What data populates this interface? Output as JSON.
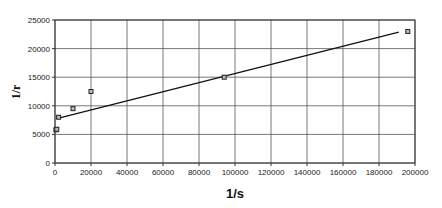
{
  "chart_data": {
    "type": "scatter",
    "title": "",
    "xlabel": "1/s",
    "ylabel": "1/r",
    "xlim": [
      0,
      200000
    ],
    "ylim": [
      0,
      25000
    ],
    "grid": true,
    "legend": null,
    "xticks": [
      0,
      20000,
      40000,
      60000,
      80000,
      100000,
      120000,
      140000,
      160000,
      180000,
      200000
    ],
    "yticks": [
      0,
      5000,
      10000,
      15000,
      20000,
      25000
    ],
    "series": [
      {
        "name": "data",
        "marker": "square",
        "points": [
          {
            "x": 500,
            "y": 5800
          },
          {
            "x": 1000,
            "y": 5900
          },
          {
            "x": 2000,
            "y": 8000
          },
          {
            "x": 10000,
            "y": 9500
          },
          {
            "x": 20000,
            "y": 12500
          },
          {
            "x": 94000,
            "y": 15000
          },
          {
            "x": 196000,
            "y": 23000
          }
        ]
      },
      {
        "name": "linear trendline",
        "type": "line",
        "points": [
          {
            "x": 1500,
            "y": 7800
          },
          {
            "x": 191000,
            "y": 22900
          }
        ]
      }
    ]
  },
  "colors": {
    "grid": "#555555",
    "axis": "#333333",
    "marker": "#222222",
    "line": "#111111"
  }
}
